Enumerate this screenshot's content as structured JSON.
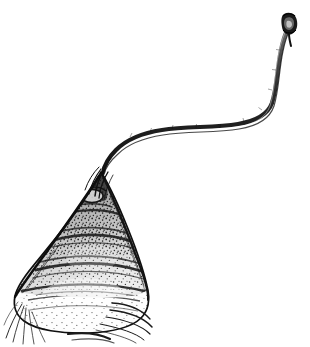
{
  "figure": {
    "domain": "Natural-Image",
    "kind": "scientific-line-drawing",
    "medium": "ink stipple and hatch engraving",
    "subject_name": "zooplankton specimen with caudal filament",
    "title": "",
    "caption": "",
    "label": "",
    "background_color": "#ffffff",
    "ink_color": "#1a1a1a",
    "mid_tone_color": "#5a5a5a",
    "light_tone_color": "#9a9a9a",
    "canvas": {
      "width": 310,
      "height": 347
    }
  },
  "parts": {
    "body": {
      "name": "conical body",
      "description": "triangular bell-shaped body, apex at top, broad rounded base",
      "apex_x": 100,
      "apex_y": 170,
      "left_extent_x": 14,
      "right_extent_x": 148,
      "base_y": 330,
      "bands": 7,
      "texture": "dense stipple with horizontal hatched bands"
    },
    "filament": {
      "name": "caudal filament",
      "description": "long S-curved filament sweeping up and right from the body apex",
      "origin_x": 103,
      "origin_y": 172,
      "apex_right_x": 272,
      "apex_right_y": 110,
      "tip_x": 290,
      "tip_y": 20,
      "stroke_width_base": 5,
      "stroke_width_tip": 2
    },
    "terminal_knob": {
      "name": "terminal knob",
      "description": "small dark bulbous swelling at the filament tip",
      "center_x": 290,
      "center_y": 22,
      "width": 13,
      "height": 17
    },
    "setae_left": {
      "name": "basal setae",
      "description": "fine bristles radiating down-left from the lower-left corner of the body",
      "count": 5,
      "origin_x": 20,
      "origin_y": 303
    },
    "setae_right": {
      "name": "posterior lobe lines",
      "description": "curved overlapping segment lines at the lower-right margin",
      "count": 4,
      "origin_x": 120,
      "origin_y": 308
    }
  }
}
